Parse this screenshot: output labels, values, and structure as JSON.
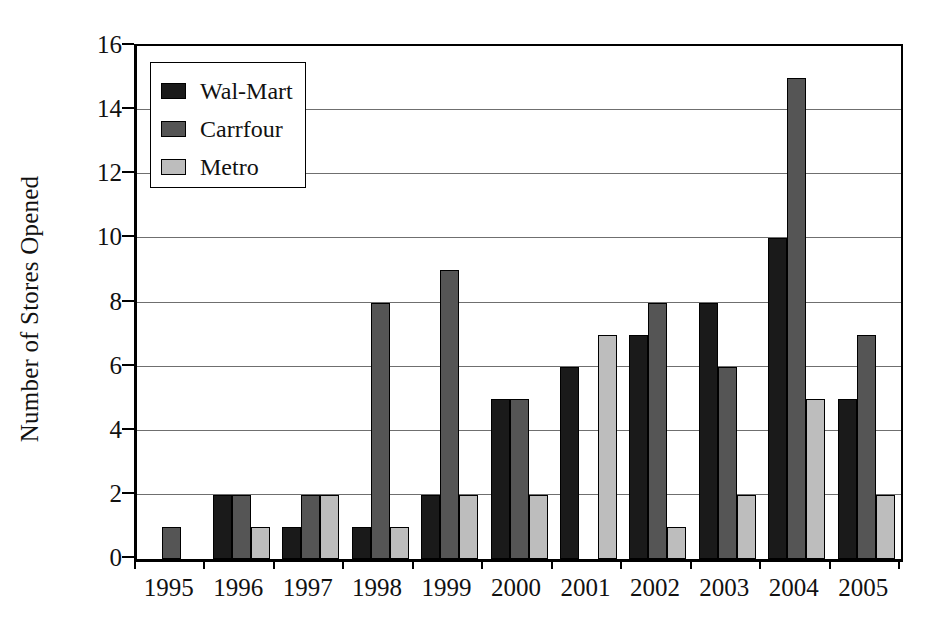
{
  "chart_data": {
    "type": "bar",
    "title": "",
    "xlabel": "",
    "ylabel": "Number of Stores Opened",
    "categories": [
      "1995",
      "1996",
      "1997",
      "1998",
      "1999",
      "2000",
      "2001",
      "2002",
      "2003",
      "2004",
      "2005"
    ],
    "series": [
      {
        "name": "Wal-Mart",
        "color": "#1a1a1a",
        "values": [
          0,
          2,
          1,
          1,
          2,
          5,
          6,
          7,
          8,
          10,
          5
        ]
      },
      {
        "name": "Carrfour",
        "color": "#555555",
        "values": [
          1,
          2,
          2,
          8,
          9,
          5,
          0,
          8,
          6,
          15,
          7
        ]
      },
      {
        "name": "Metro",
        "color": "#bdbdbd",
        "values": [
          0,
          1,
          2,
          1,
          2,
          2,
          7,
          1,
          2,
          5,
          2
        ]
      }
    ],
    "ylim": [
      0,
      16
    ],
    "ytick_values": [
      0,
      2,
      4,
      6,
      8,
      10,
      12,
      14,
      16
    ],
    "ytick_labels": [
      "0",
      "2",
      "4",
      "6",
      "8",
      "10",
      "12",
      "14",
      "16"
    ],
    "grid": true,
    "grid_axis": "y",
    "legend_position": "upper-left-inside",
    "legend_entries": [
      "Wal-Mart",
      "Carrfour",
      "Metro"
    ]
  },
  "axes": {
    "y_title": "Number of Stores Opened"
  },
  "legend": {
    "items": [
      {
        "label": "Wal-Mart",
        "swatch": "legend-swatch-walmart"
      },
      {
        "label": "Carrfour",
        "swatch": "legend-swatch-carrfour"
      },
      {
        "label": "Metro",
        "swatch": "legend-swatch-metro"
      }
    ]
  },
  "colors": {
    "walmart": "#1a1a1a",
    "carrfour": "#555555",
    "metro": "#bdbdbd",
    "axis": "#000000",
    "gridline": "#6f6f6f",
    "background": "#ffffff"
  }
}
